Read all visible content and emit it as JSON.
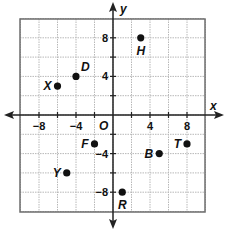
{
  "chart_data": {
    "type": "scatter",
    "title": "",
    "xlabel": "x",
    "ylabel": "y",
    "origin_label": "O",
    "xlim": [
      -10,
      10
    ],
    "ylim": [
      -10,
      10
    ],
    "grid": true,
    "grid_step": 2,
    "x_ticks": [
      {
        "value": -8,
        "label": "−8"
      },
      {
        "value": -4,
        "label": "−4"
      },
      {
        "value": 4,
        "label": "4"
      },
      {
        "value": 8,
        "label": "8"
      }
    ],
    "y_ticks": [
      {
        "value": 8,
        "label": "8"
      },
      {
        "value": 4,
        "label": "4"
      },
      {
        "value": -4,
        "label": "−4"
      },
      {
        "value": -8,
        "label": "−8"
      }
    ],
    "points": [
      {
        "name": "X",
        "x": -6,
        "y": 3,
        "label_pos": "left"
      },
      {
        "name": "D",
        "x": -4,
        "y": 4,
        "label_pos": "upper-right"
      },
      {
        "name": "H",
        "x": 3,
        "y": 8,
        "label_pos": "below"
      },
      {
        "name": "F",
        "x": -2,
        "y": -3,
        "label_pos": "left"
      },
      {
        "name": "Y",
        "x": -5,
        "y": -6,
        "label_pos": "left"
      },
      {
        "name": "B",
        "x": 5,
        "y": -4,
        "label_pos": "left"
      },
      {
        "name": "T",
        "x": 8,
        "y": -3,
        "label_pos": "left"
      },
      {
        "name": "R",
        "x": 1,
        "y": -8,
        "label_pos": "below"
      }
    ],
    "colors": {
      "grid": "#b8b8b8",
      "border": "#6e6e6e",
      "axis": "#222222",
      "point": "#111111"
    }
  }
}
